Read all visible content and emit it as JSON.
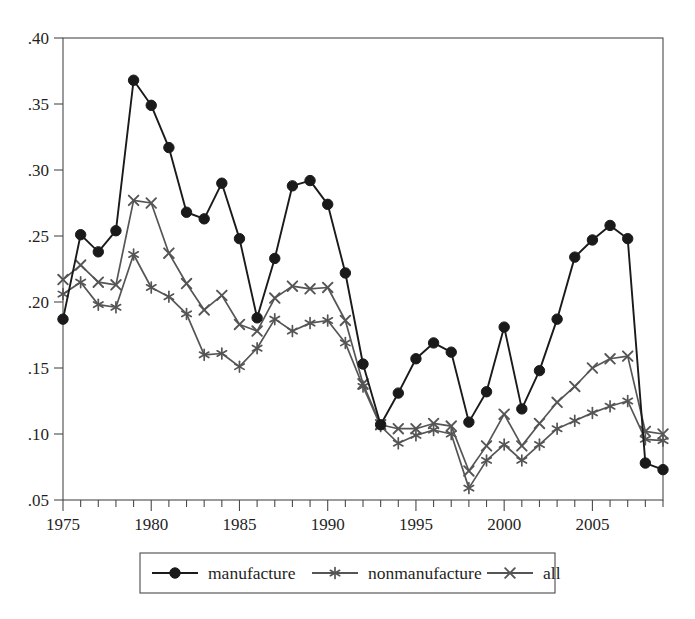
{
  "chart_data": {
    "type": "line",
    "title": "",
    "subtitle": "",
    "xlabel": "",
    "ylabel": "",
    "xlim": [
      1975,
      2009
    ],
    "ylim": [
      0.05,
      0.4
    ],
    "grid": false,
    "legend_position": "bottom",
    "x": [
      1975,
      1976,
      1977,
      1978,
      1979,
      1980,
      1981,
      1982,
      1983,
      1984,
      1985,
      1986,
      1987,
      1988,
      1989,
      1990,
      1991,
      1992,
      1993,
      1994,
      1995,
      1996,
      1997,
      1998,
      1999,
      2000,
      2001,
      2002,
      2003,
      2004,
      2005,
      2006,
      2007,
      2008,
      2009
    ],
    "xticks": [
      1975,
      1980,
      1985,
      1990,
      1995,
      2000,
      2005
    ],
    "xticklabels": [
      "1975",
      "1980",
      "1985",
      "1990",
      "1995",
      "2000",
      "2005"
    ],
    "yticks": [
      0.05,
      0.1,
      0.15,
      0.2,
      0.25,
      0.3,
      0.35,
      0.4
    ],
    "yticklabels": [
      ".05",
      ".10",
      ".15",
      ".20",
      ".25",
      ".30",
      ".35",
      ".40"
    ],
    "series": [
      {
        "name": "manufacture",
        "marker": "filled-circle",
        "color": "#1a1a1a",
        "values": [
          0.187,
          0.251,
          0.238,
          0.254,
          0.368,
          0.349,
          0.317,
          0.268,
          0.263,
          0.29,
          0.248,
          0.188,
          0.233,
          0.288,
          0.292,
          0.274,
          0.222,
          0.153,
          0.107,
          0.131,
          0.157,
          0.169,
          0.162,
          0.109,
          0.132,
          0.181,
          0.119,
          0.148,
          0.187,
          0.234,
          0.247,
          0.258,
          0.248,
          0.078,
          0.073
        ]
      },
      {
        "name": "nonmanufacture",
        "marker": "asterisk",
        "color": "#555555",
        "values": [
          0.206,
          0.215,
          0.198,
          0.196,
          0.236,
          0.211,
          0.204,
          0.191,
          0.16,
          0.161,
          0.151,
          0.165,
          0.187,
          0.178,
          0.184,
          0.186,
          0.169,
          0.136,
          0.106,
          0.093,
          0.099,
          0.103,
          0.1,
          0.059,
          0.08,
          0.092,
          0.08,
          0.092,
          0.104,
          0.11,
          0.116,
          0.121,
          0.125,
          0.096,
          0.095
        ]
      },
      {
        "name": "all",
        "marker": "cross",
        "color": "#555555",
        "values": [
          0.217,
          0.228,
          0.215,
          0.213,
          0.277,
          0.275,
          0.237,
          0.214,
          0.194,
          0.205,
          0.183,
          0.178,
          0.203,
          0.212,
          0.21,
          0.211,
          0.186,
          0.138,
          0.107,
          0.104,
          0.104,
          0.108,
          0.106,
          0.072,
          0.091,
          0.115,
          0.091,
          0.108,
          0.124,
          0.136,
          0.15,
          0.157,
          0.159,
          0.102,
          0.1
        ]
      }
    ]
  },
  "legend": {
    "items": [
      {
        "label": "manufacture",
        "marker": "filled-circle",
        "color": "#1a1a1a"
      },
      {
        "label": "nonmanufacture",
        "marker": "asterisk",
        "color": "#555555"
      },
      {
        "label": "all",
        "marker": "cross",
        "color": "#555555"
      }
    ]
  }
}
